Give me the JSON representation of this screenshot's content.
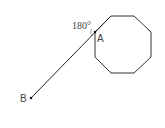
{
  "diagram": {
    "angle_label": "180°",
    "point_a_label": "A",
    "point_b_label": "B",
    "octagon": {
      "points": "111,16 134,16 151,32 151,57 134,73 111,73 95,57 95,32",
      "stroke": "#333333"
    },
    "segment": {
      "x1": 31,
      "y1": 98,
      "x2": 111,
      "y2": 16,
      "stroke": "#222222"
    },
    "point_a": {
      "x": 95,
      "y": 32
    },
    "point_b": {
      "x": 31,
      "y": 98
    }
  }
}
